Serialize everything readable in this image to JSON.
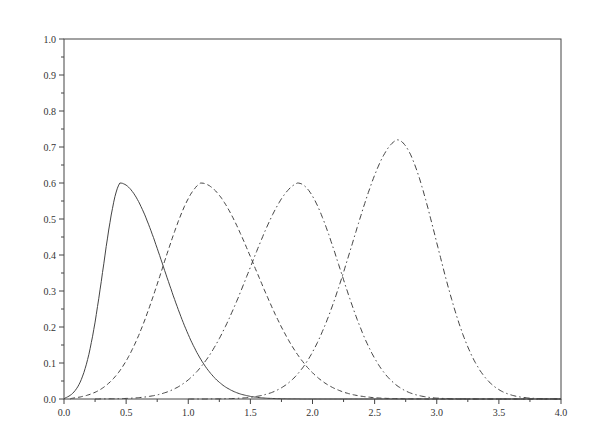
{
  "chart_data": {
    "type": "line",
    "title": "",
    "xlabel": "",
    "ylabel": "",
    "xlim": [
      0.0,
      4.0
    ],
    "ylim": [
      0.0,
      1.0
    ],
    "grid": false,
    "legend": null,
    "xticks": [
      "0.0",
      "0.5",
      "1.0",
      "1.5",
      "2.0",
      "2.5",
      "3.0",
      "3.5",
      "4.0"
    ],
    "yticks": [
      "0.0",
      "0.1",
      "0.2",
      "0.3",
      "0.4",
      "0.5",
      "0.6",
      "0.7",
      "0.8",
      "0.9",
      "1.0"
    ],
    "series": [
      {
        "name": "curve-1",
        "style": "solid",
        "peak_x": 0.45,
        "peak_y": 0.6,
        "wl": 0.22,
        "wr": 0.5,
        "start": 0.0
      },
      {
        "name": "curve-2",
        "style": "dashed",
        "peak_x": 1.1,
        "peak_y": 0.6,
        "wl": 0.5,
        "wr": 0.62,
        "start": 0.05
      },
      {
        "name": "curve-3",
        "style": "dashdot",
        "peak_x": 1.88,
        "peak_y": 0.6,
        "wl": 0.6,
        "wr": 0.48,
        "start": 0.25
      },
      {
        "name": "curve-4",
        "style": "dashdot",
        "peak_x": 2.68,
        "peak_y": 0.72,
        "wl": 0.55,
        "wr": 0.45,
        "start": 1.0
      }
    ]
  }
}
